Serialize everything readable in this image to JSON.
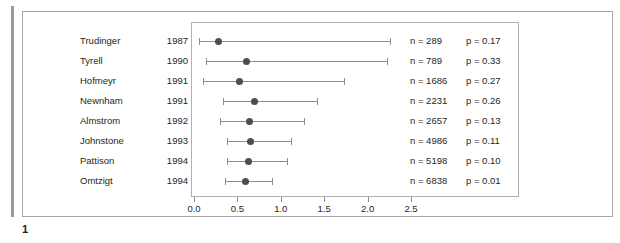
{
  "figure": {
    "caption_number": "1"
  },
  "chart_data": {
    "type": "scatter",
    "subtype": "forest-plot",
    "title": "",
    "xlabel": "",
    "ylabel": "",
    "xlim": [
      0.0,
      2.5
    ],
    "xticks": [
      "0.0",
      "0.5",
      "1.0",
      "1.5",
      "2.0",
      "2.5"
    ],
    "xtick_values": [
      0.0,
      0.5,
      1.0,
      1.5,
      2.0,
      2.5
    ],
    "grid": false,
    "legend": "none",
    "columns": [
      "study",
      "year",
      "estimate",
      "ci_low",
      "ci_high",
      "n",
      "p"
    ],
    "rows": [
      {
        "study": "Trudinger",
        "year": "1987",
        "estimate": 0.28,
        "ci_low": 0.06,
        "ci_high": 2.26,
        "n_label": "n = 289",
        "p_label": "p = 0.17",
        "n": 289,
        "p": 0.17
      },
      {
        "study": "Tyrell",
        "year": "1990",
        "estimate": 0.6,
        "ci_low": 0.14,
        "ci_high": 2.22,
        "n_label": "n = 789",
        "p_label": "p = 0.33",
        "n": 789,
        "p": 0.33
      },
      {
        "study": "Hofmeyr",
        "year": "1991",
        "estimate": 0.52,
        "ci_low": 0.1,
        "ci_high": 1.73,
        "n_label": "n = 1686",
        "p_label": "p = 0.27",
        "n": 1686,
        "p": 0.27
      },
      {
        "study": "Newnham",
        "year": "1991",
        "estimate": 0.7,
        "ci_low": 0.33,
        "ci_high": 1.42,
        "n_label": "n = 2231",
        "p_label": "p = 0.26",
        "n": 2231,
        "p": 0.26
      },
      {
        "study": "Almstrom",
        "year": "1992",
        "estimate": 0.64,
        "ci_low": 0.3,
        "ci_high": 1.27,
        "n_label": "n = 2657",
        "p_label": "p = 0.13",
        "n": 2657,
        "p": 0.13
      },
      {
        "study": "Johnstone",
        "year": "1993",
        "estimate": 0.65,
        "ci_low": 0.38,
        "ci_high": 1.12,
        "n_label": "n = 4986",
        "p_label": "p = 0.11",
        "n": 4986,
        "p": 0.11
      },
      {
        "study": "Pattison",
        "year": "1994",
        "estimate": 0.63,
        "ci_low": 0.38,
        "ci_high": 1.07,
        "n_label": "n = 5198",
        "p_label": "p = 0.10",
        "n": 5198,
        "p": 0.1
      },
      {
        "study": "Omtzigt",
        "year": "1994",
        "estimate": 0.59,
        "ci_low": 0.36,
        "ci_high": 0.9,
        "n_label": "n = 6838",
        "p_label": "p = 0.01",
        "n": 6838,
        "p": 0.01
      }
    ]
  },
  "style": {
    "marker_color": "#4d4d4d",
    "line_color": "#8d8d8d",
    "frame_color": "#a8a8a8",
    "text_color": "#231f20"
  }
}
